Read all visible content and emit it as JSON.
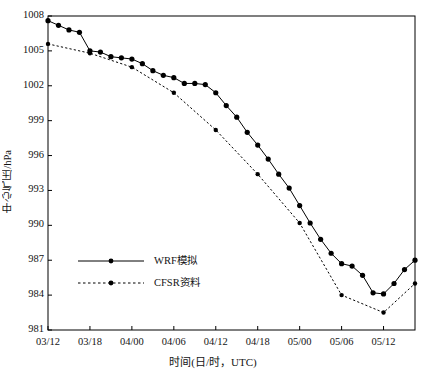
{
  "chart_data": {
    "type": "line",
    "title": "",
    "xlabel": "时间(日/时，UTC)",
    "ylabel": "中心气压/hPa",
    "grid": false,
    "legend_position": "inner-bottom-left",
    "xlim": [
      0,
      48
    ],
    "ylim": [
      981,
      1008
    ],
    "yticks": [
      981,
      984,
      987,
      990,
      993,
      996,
      999,
      1002,
      1005,
      1008
    ],
    "xticks": [
      0,
      6,
      12,
      18,
      24,
      30,
      36,
      42,
      48
    ],
    "xtick_labels": [
      "03/12",
      "03/18",
      "04/00",
      "04/06",
      "04/12",
      "04/18",
      "05/00",
      "05/06",
      "05/12"
    ],
    "series": [
      {
        "name": "WRF模拟",
        "line_style": "solid",
        "color": "#000000",
        "marker": "filled-circle",
        "x": [
          0,
          1.5,
          3,
          4.5,
          6,
          7.5,
          9,
          10.5,
          12,
          13.5,
          15,
          16.5,
          18,
          19.5,
          21,
          22.5,
          24,
          25.5,
          27,
          28.5,
          30,
          31.5,
          33,
          34.5,
          36,
          37.5,
          39,
          40.5,
          42,
          43.5,
          45,
          46.5,
          48
        ],
        "values": [
          1007.6,
          1007.2,
          1006.8,
          1006.6,
          1005.0,
          1004.9,
          1004.5,
          1004.4,
          1004.3,
          1003.9,
          1003.3,
          1002.9,
          1002.7,
          1002.2,
          1002.2,
          1002.1,
          1001.4,
          1000.3,
          999.3,
          998.0,
          996.9,
          995.7,
          994.4,
          993.2,
          991.7,
          990.2,
          988.8,
          987.6,
          986.7,
          986.5,
          985.7,
          984.2,
          984.1
        ]
      },
      {
        "name": "CFSR资料",
        "line_style": "dashed",
        "color": "#000000",
        "marker": "filled-circle",
        "x": [
          0,
          6,
          12,
          18,
          24,
          30,
          36,
          42,
          48
        ],
        "values": [
          1005.6,
          1004.8,
          1003.6,
          1001.4,
          998.2,
          994.4,
          990.2,
          984.0,
          982.5
        ]
      }
    ],
    "series_tail": [
      {
        "name": "WRF模拟",
        "x": [
          48,
          49.5,
          51,
          52.5
        ],
        "values": [
          984.1,
          985.0,
          986.2,
          987.0
        ]
      },
      {
        "name": "CFSR资料",
        "x": [
          48,
          52.5
        ],
        "values": [
          982.5,
          985.0
        ]
      }
    ]
  },
  "legend": {
    "items": [
      {
        "label": "WRF模拟",
        "style": "solid"
      },
      {
        "label": "CFSR资料",
        "style": "dashed"
      }
    ]
  }
}
